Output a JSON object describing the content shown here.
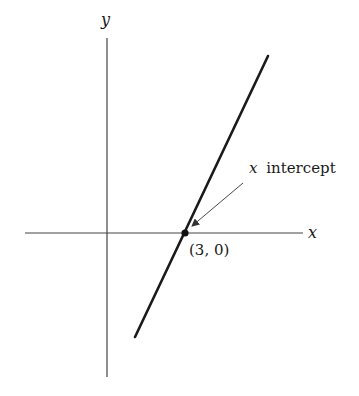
{
  "diagram": {
    "type": "line-graph",
    "axes": {
      "x_label": "x",
      "y_label": "y"
    },
    "line": {
      "description": "straight line with positive slope crossing x axis",
      "stroke_color": "#1a1a1a"
    },
    "point": {
      "label": "(3, 0)",
      "x": 3,
      "y": 0
    },
    "annotation": {
      "var": "x",
      "text": "intercept"
    },
    "colors": {
      "axis": "#333333",
      "line": "#1a1a1a",
      "background": "#ffffff"
    }
  }
}
